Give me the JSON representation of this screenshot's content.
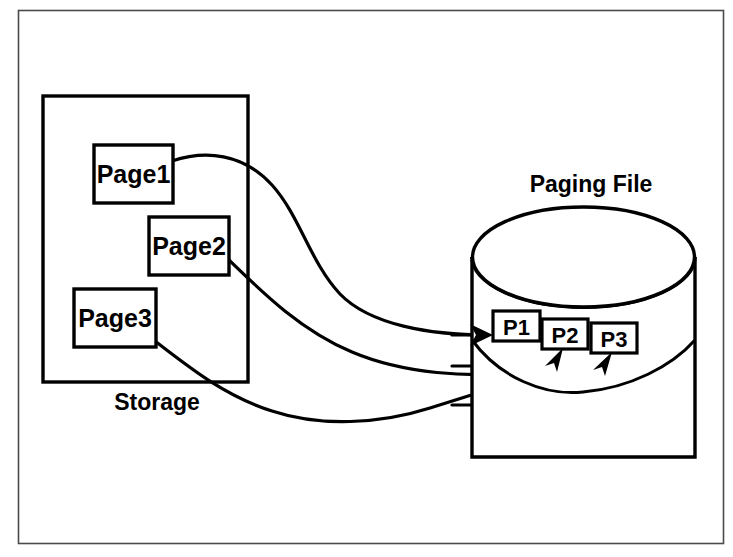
{
  "diagram": {
    "title_storage": "Storage",
    "title_paging_file": "Paging File",
    "colors": {
      "stroke": "#000000",
      "fill": "#ffffff",
      "frame": "#3a3a3a"
    },
    "storage_box": {
      "caption": "Storage",
      "pages": [
        {
          "label": "Page1"
        },
        {
          "label": "Page2"
        },
        {
          "label": "Page3"
        }
      ]
    },
    "paging_file": {
      "caption": "Paging File",
      "slots": [
        {
          "label": "P1"
        },
        {
          "label": "P2"
        },
        {
          "label": "P3"
        }
      ]
    },
    "flows": [
      {
        "from": "Page1",
        "to": "P1"
      },
      {
        "from": "Page2",
        "to": "P2"
      },
      {
        "from": "Page3",
        "to": "P3"
      }
    ]
  }
}
